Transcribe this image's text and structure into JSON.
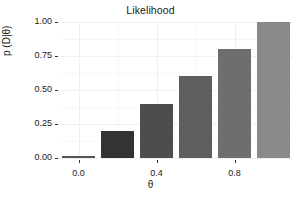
{
  "chart_data": {
    "type": "bar",
    "title": "Likelihood",
    "xlabel": "θ",
    "ylabel": "p (D|θ)",
    "categories": [
      "0.0",
      "0.2",
      "0.4",
      "0.6",
      "0.8",
      "1.0"
    ],
    "x": [
      0.0,
      0.2,
      0.4,
      0.6,
      0.8,
      1.0
    ],
    "values": [
      0.0,
      0.2,
      0.4,
      0.6,
      0.8,
      1.0
    ],
    "bar_colors": [
      "#2b2b2b",
      "#333333",
      "#4d4d4d",
      "#5e5e5e",
      "#6e6e6e",
      "#8a8a8a"
    ],
    "xlim": [
      -0.1,
      1.1
    ],
    "ylim": [
      0.0,
      1.0
    ],
    "grid": true,
    "legend": "none",
    "y_ticks": [
      {
        "value": 0.0,
        "label": "0.00"
      },
      {
        "value": 0.25,
        "label": "0.25"
      },
      {
        "value": 0.5,
        "label": "0.50"
      },
      {
        "value": 0.75,
        "label": "0.75"
      },
      {
        "value": 1.0,
        "label": "1.00"
      }
    ],
    "x_ticks": [
      {
        "value": 0.0,
        "label": "0.0"
      },
      {
        "value": 0.4,
        "label": "0.4"
      },
      {
        "value": 0.8,
        "label": "0.8"
      }
    ]
  },
  "axes": {
    "y_labels": [
      "1.00",
      "0.75",
      "0.50",
      "0.25",
      "0.00"
    ],
    "x_labels": [
      "0.0",
      "0.4",
      "0.8"
    ]
  },
  "colors": {
    "background": "#ffffff",
    "text": "#1a1a1a",
    "gridline": "#f0f0f0",
    "tick": "#333333"
  }
}
